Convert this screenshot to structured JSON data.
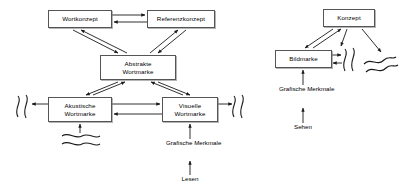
{
  "diagram": {
    "type": "node-link-diagram",
    "language": "de",
    "colors": {
      "background": "#ffffff",
      "box_border": "#555555",
      "box_fill": "#ffffff",
      "line": "#1a1a1a",
      "text": "#000000"
    },
    "left_model": {
      "name": "Wortmarke",
      "nodes": [
        {
          "id": "wortkonzept",
          "label": "Wortkonzept",
          "lines": [
            "Wortkonzept"
          ],
          "x": 48,
          "y": 10,
          "w": 64,
          "h": 18
        },
        {
          "id": "referenzkonzept",
          "label": "Referenzkonzept",
          "lines": [
            "Referenzkonzept"
          ],
          "x": 147,
          "y": 10,
          "w": 68,
          "h": 18
        },
        {
          "id": "abstrakte_wortmarke",
          "label": "Abstrakte Wortmarke",
          "lines": [
            "Abstrakte",
            "Wortmarke"
          ],
          "x": 100,
          "y": 55,
          "w": 76,
          "h": 25
        },
        {
          "id": "akustische_wortmarke",
          "label": "Akustische Wortmarke",
          "lines": [
            "Akustische",
            "Wortmarke"
          ],
          "x": 48,
          "y": 97,
          "w": 64,
          "h": 25
        },
        {
          "id": "visuelle_wortmarke",
          "label": "Visuelle Wortmarke",
          "lines": [
            "Visuelle",
            "Wortmarke"
          ],
          "x": 162,
          "y": 97,
          "w": 56,
          "h": 25
        }
      ],
      "labels": [
        {
          "id": "grafische_merkmale_left",
          "lines": [
            "Grafische",
            "Merkmale"
          ],
          "x": 190,
          "y": 141
        },
        {
          "id": "lesen",
          "lines": [
            "Lesen"
          ],
          "x": 190,
          "y": 177
        }
      ],
      "waves": [
        {
          "id": "wave-acoustic-left",
          "orientation": "vertical",
          "x": 16,
          "y": 95
        },
        {
          "id": "wave-acoustic-below",
          "orientation": "horizontal",
          "x": 62,
          "y": 131
        },
        {
          "id": "wave-visual-right",
          "orientation": "vertical",
          "x": 228,
          "y": 95
        }
      ],
      "edges": [
        {
          "from": "wortkonzept",
          "to": "referenzkonzept",
          "direction": "right"
        },
        {
          "from": "referenzkonzept",
          "to": "wortkonzept",
          "direction": "left"
        },
        {
          "from": "wortkonzept",
          "to": "abstrakte_wortmarke",
          "direction": "both"
        },
        {
          "from": "referenzkonzept",
          "to": "abstrakte_wortmarke",
          "direction": "both"
        },
        {
          "from": "abstrakte_wortmarke",
          "to": "akustische_wortmarke",
          "direction": "both"
        },
        {
          "from": "abstrakte_wortmarke",
          "to": "visuelle_wortmarke",
          "direction": "both"
        },
        {
          "from": "akustische_wortmarke",
          "to": "visuelle_wortmarke",
          "direction": "right"
        },
        {
          "from": "visuelle_wortmarke",
          "to": "akustische_wortmarke",
          "direction": "left"
        },
        {
          "from": "akustische_wortmarke",
          "to": "wave-acoustic-left",
          "direction": "left"
        },
        {
          "from": "wave-acoustic-below",
          "to": "akustische_wortmarke",
          "direction": "up"
        },
        {
          "from": "visuelle_wortmarke",
          "to": "wave-visual-right",
          "direction": "right"
        },
        {
          "from": "grafische_merkmale_left",
          "to": "visuelle_wortmarke",
          "direction": "up"
        },
        {
          "from": "lesen",
          "to": "grafische_merkmale_left",
          "direction": "up"
        }
      ]
    },
    "right_model": {
      "name": "Bildmarke",
      "nodes": [
        {
          "id": "konzept",
          "label": "Konzept",
          "lines": [
            "Konzept"
          ],
          "x": 323,
          "y": 9,
          "w": 52,
          "h": 18
        },
        {
          "id": "bildmarke",
          "label": "Bildmarke",
          "lines": [
            "Bildmarke"
          ],
          "x": 275,
          "y": 50,
          "w": 57,
          "h": 18
        }
      ],
      "labels": [
        {
          "id": "grafische_merkmale_right",
          "lines": [
            "Grafische",
            "Merkmale"
          ],
          "x": 303,
          "y": 87
        },
        {
          "id": "sehen",
          "lines": [
            "Sehen"
          ],
          "x": 303,
          "y": 125
        }
      ],
      "waves": [
        {
          "id": "wave-bildmarke-right",
          "orientation": "vertical",
          "x": 338,
          "y": 48
        },
        {
          "id": "wave-konzept-diagonal",
          "orientation": "diagonal",
          "x": 362,
          "y": 54
        }
      ],
      "edges": [
        {
          "from": "konzept",
          "to": "bildmarke",
          "direction": "both"
        },
        {
          "from": "bildmarke",
          "to": "wave-bildmarke-right",
          "direction": "right"
        },
        {
          "from": "wave-bildmarke-right",
          "to": "bildmarke",
          "direction": "left"
        },
        {
          "from": "konzept",
          "to": "wave-konzept-diagonal",
          "direction": "down-right"
        },
        {
          "from": "konzept",
          "to": "wave-bildmarke-right",
          "direction": "down-left"
        },
        {
          "from": "grafische_merkmale_right",
          "to": "bildmarke",
          "direction": "up"
        },
        {
          "from": "sehen",
          "to": "grafische_merkmale_right",
          "direction": "up"
        }
      ]
    }
  }
}
